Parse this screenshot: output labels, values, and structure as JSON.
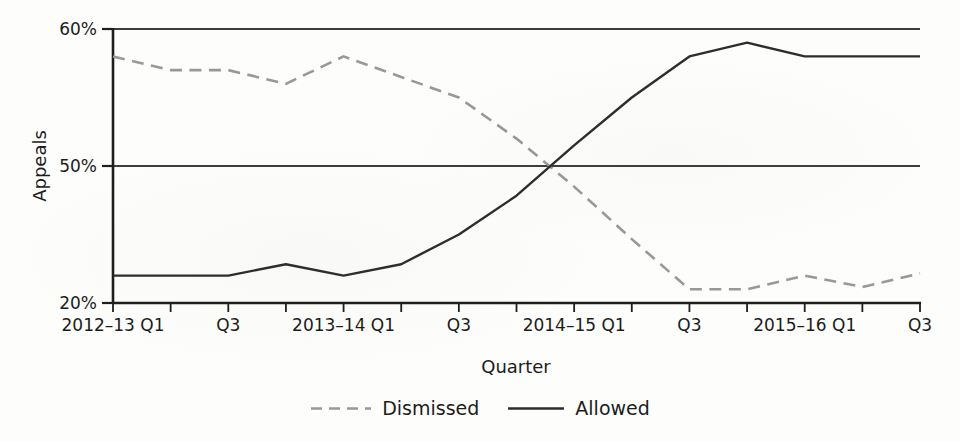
{
  "chart_data": {
    "type": "line",
    "title": "",
    "xlabel": "Quarter",
    "ylabel": "Appeals",
    "categories": [
      "2012–13 Q1",
      "2012–13 Q2",
      "2012–13 Q3",
      "2012–13 Q4",
      "2013–14 Q1",
      "2013–14 Q2",
      "2013–14 Q3",
      "2013–14 Q4",
      "2014–15 Q1",
      "2014–15 Q2",
      "2014–15 Q3",
      "2014–15 Q4",
      "2015–16 Q1",
      "2015–16 Q2",
      "2015–16 Q3"
    ],
    "x_tick_labels": [
      "2012–13 Q1",
      "Q3",
      "2013–14 Q1",
      "Q3",
      "2014–15 Q1",
      "Q3",
      "2015–16 Q1",
      "Q3"
    ],
    "x_tick_label_indices": [
      0,
      2,
      4,
      6,
      8,
      10,
      12,
      14
    ],
    "y_ticks": [
      {
        "value": 20,
        "label": "20%"
      },
      {
        "value": 50,
        "label": "50%"
      },
      {
        "value": 60,
        "label": "60%"
      }
    ],
    "ylim": [
      20,
      60
    ],
    "y_scale_note": "non-linear axis: the 20–50 band and the 50–60 band are drawn with equal height",
    "grid": "horizontal gridlines at 50% and 60% only",
    "legend_position": "bottom center",
    "series": [
      {
        "name": "Dismissed",
        "line_style": "dashed",
        "color": "#989898",
        "values": [
          58,
          57,
          57,
          56,
          58,
          56.5,
          55,
          52,
          45.5,
          34,
          23,
          23,
          26,
          23.5,
          26.5
        ]
      },
      {
        "name": "Allowed",
        "line_style": "solid",
        "color": "#2d2d2d",
        "values": [
          26,
          26,
          26,
          28.5,
          26,
          28.5,
          35,
          43.5,
          51.5,
          55,
          58,
          59,
          58,
          58,
          58
        ]
      }
    ]
  },
  "colors": {
    "axis": "#1e1e1e",
    "gridline": "#3e3e3e",
    "text": "#1c1c1c",
    "background": "#fdfdfb"
  }
}
